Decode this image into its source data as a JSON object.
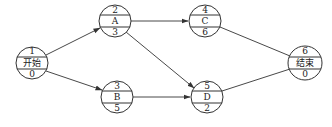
{
  "diagram": {
    "type": "activity-network",
    "nodes": [
      {
        "id": "start",
        "top": "1",
        "middle": "开始",
        "bottom": "0",
        "cx": 32,
        "cy": 63,
        "r": 16
      },
      {
        "id": "A",
        "top": "2",
        "middle": "A",
        "bottom": "3",
        "cx": 115,
        "cy": 21,
        "r": 16
      },
      {
        "id": "B",
        "top": "3",
        "middle": "B",
        "bottom": "5",
        "cx": 117,
        "cy": 97,
        "r": 16
      },
      {
        "id": "C",
        "top": "4",
        "middle": "C",
        "bottom": "6",
        "cx": 205,
        "cy": 21,
        "r": 16
      },
      {
        "id": "D",
        "top": "5",
        "middle": "D",
        "bottom": "2",
        "cx": 207,
        "cy": 97,
        "r": 16
      },
      {
        "id": "end",
        "top": "6",
        "middle": "结束",
        "bottom": "0",
        "cx": 305,
        "cy": 63,
        "r": 17
      }
    ],
    "edges": [
      {
        "from": "start",
        "to": "A",
        "arrow": true
      },
      {
        "from": "start",
        "to": "B",
        "arrow": true
      },
      {
        "from": "A",
        "to": "C",
        "arrow": true
      },
      {
        "from": "A",
        "to": "D",
        "arrow": true
      },
      {
        "from": "B",
        "to": "D",
        "arrow": true
      },
      {
        "from": "C",
        "to": "end",
        "arrow": false
      },
      {
        "from": "D",
        "to": "end",
        "arrow": false
      }
    ]
  }
}
